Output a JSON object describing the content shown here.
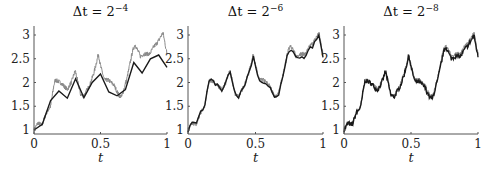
{
  "chart_data": [
    {
      "type": "line",
      "title": "Δt = 2^-4",
      "title_base": "Δt = 2",
      "title_exp": "−4",
      "xlabel": "t",
      "ylabel": "",
      "xlim": [
        0,
        1
      ],
      "ylim": [
        0.95,
        3.2
      ],
      "xticks": [
        "0",
        "0.5",
        "1"
      ],
      "yticks": [
        "1",
        "1.5",
        "2",
        "2.5",
        "3"
      ],
      "grid": false,
      "series": [
        {
          "name": "exact (fine path)",
          "color": "#8a8a8a",
          "role": "fine"
        },
        {
          "name": "approximation Δt=1/16",
          "color": "#1a1a1a",
          "role": "coarse",
          "x": [
            0,
            0.0625,
            0.125,
            0.1875,
            0.25,
            0.3125,
            0.375,
            0.4375,
            0.5,
            0.5625,
            0.625,
            0.6875,
            0.75,
            0.8125,
            0.875,
            0.9375,
            1
          ],
          "y": [
            1.0,
            1.12,
            1.62,
            1.82,
            1.67,
            2.08,
            1.68,
            2.0,
            2.18,
            1.8,
            1.72,
            1.85,
            2.42,
            2.2,
            2.5,
            2.58,
            2.32
          ]
        }
      ]
    },
    {
      "type": "line",
      "title": "Δt = 2^-6",
      "title_base": "Δt = 2",
      "title_exp": "−6",
      "xlabel": "t",
      "xlim": [
        0,
        1
      ],
      "ylim": [
        0.95,
        3.2
      ],
      "xticks": [
        "0",
        "0.5",
        "1"
      ],
      "yticks": [
        "1",
        "1.5",
        "2",
        "2.5",
        "3"
      ],
      "grid": false,
      "series": [
        {
          "name": "exact (fine path)",
          "color": "#8a8a8a",
          "role": "fine"
        },
        {
          "name": "approximation Δt=1/64",
          "color": "#1a1a1a",
          "role": "coarse",
          "step": 0.015625
        }
      ]
    },
    {
      "type": "line",
      "title": "Δt = 2^-8",
      "title_base": "Δt = 2",
      "title_exp": "−8",
      "xlabel": "t",
      "xlim": [
        0,
        1
      ],
      "ylim": [
        0.95,
        3.2
      ],
      "xticks": [
        "0",
        "0.5",
        "1"
      ],
      "yticks": [
        "1",
        "1.5",
        "2",
        "2.5",
        "3"
      ],
      "grid": false,
      "series": [
        {
          "name": "exact (fine path)",
          "color": "#8a8a8a",
          "role": "fine"
        },
        {
          "name": "approximation Δt=1/256",
          "color": "#1a1a1a",
          "role": "coarse",
          "step": 0.00390625
        }
      ]
    }
  ],
  "fine_path_anchor": {
    "x": [
      0,
      0.03,
      0.06,
      0.09,
      0.125,
      0.15,
      0.16,
      0.2,
      0.25,
      0.28,
      0.31,
      0.35,
      0.375,
      0.42,
      0.45,
      0.485,
      0.5,
      0.53,
      0.56,
      0.6,
      0.64,
      0.66,
      0.7,
      0.74,
      0.76,
      0.8,
      0.83,
      0.87,
      0.9,
      0.93,
      0.95,
      0.97,
      1.0
    ],
    "y": [
      1.0,
      1.15,
      1.1,
      1.35,
      1.5,
      1.95,
      2.05,
      2.0,
      1.85,
      2.0,
      2.25,
      1.75,
      1.72,
      1.95,
      2.2,
      2.6,
      2.35,
      2.05,
      2.05,
      1.95,
      1.72,
      1.7,
      2.1,
      2.65,
      2.8,
      2.55,
      2.6,
      2.6,
      2.75,
      2.85,
      2.95,
      3.05,
      2.6
    ]
  }
}
